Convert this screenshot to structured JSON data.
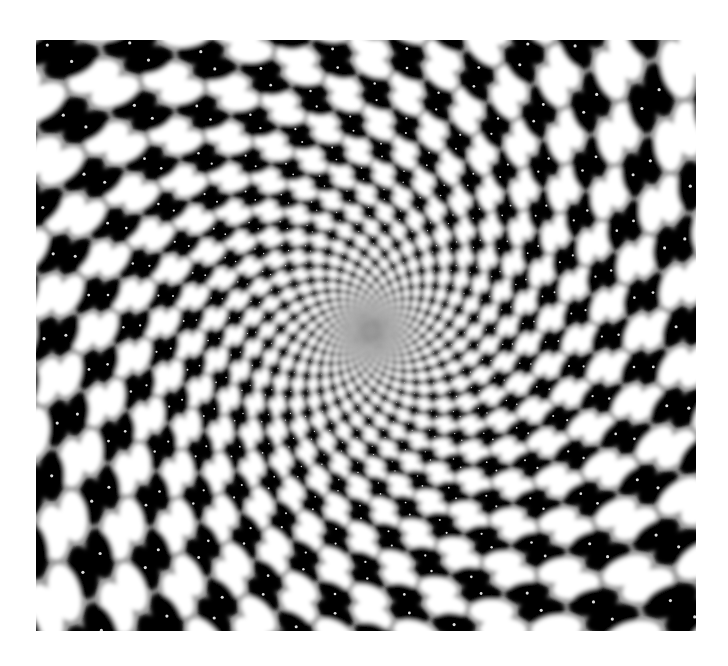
{
  "page": {
    "background": "#ffffff",
    "caption": "Radial op-art optical illusion"
  },
  "illusion": {
    "frame": {
      "x": 36,
      "y": 40,
      "width": 660,
      "height": 591
    },
    "center": {
      "x": 371,
      "y": 331
    },
    "spokes": 48,
    "twist_per_ring_deg": 3.2,
    "ring_start_radius": 6,
    "ring_growth": 1.072,
    "ring_count": 72,
    "dot_aspect": 0.62,
    "colors": {
      "background": "#9a9a9a",
      "dark": "#000000",
      "light": "#ffffff",
      "speck": "#ffffff"
    },
    "blur_px": 2.2
  }
}
